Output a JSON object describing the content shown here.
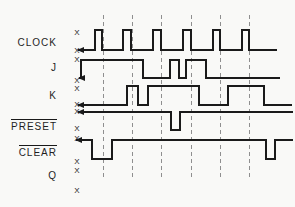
{
  "chart_data": {
    "type": "timing-diagram",
    "background": "#f9f9f7",
    "line_color": "#1a1a1a",
    "dash_color": "#8f8f8f",
    "mark_color": "#222222",
    "unknown_mark_glyph": "X",
    "dashed_lines": {
      "xs": [
        103.5,
        132.5,
        161.5,
        191.5,
        220.5,
        249.5
      ],
      "y_top": 15,
      "y_bottom": 178
    },
    "signals": [
      {
        "label": "CLOCK",
        "overline": false,
        "x_marks": [
          {
            "x": 77,
            "y": 32
          },
          {
            "x": 77,
            "y": 50
          }
        ],
        "waveform": {
          "start_x": 78,
          "end_x": 277,
          "start_level": 0,
          "high_y": 30,
          "low_y": 50,
          "arrow": true,
          "transitions": [
            {
              "x": 95,
              "to": 1
            },
            {
              "x": 102,
              "to": 0
            },
            {
              "x": 123,
              "to": 1
            },
            {
              "x": 131,
              "to": 0
            },
            {
              "x": 153,
              "to": 1
            },
            {
              "x": 161,
              "to": 0
            },
            {
              "x": 183,
              "to": 1
            },
            {
              "x": 191,
              "to": 0
            },
            {
              "x": 213,
              "to": 1
            },
            {
              "x": 220,
              "to": 0
            },
            {
              "x": 242,
              "to": 1
            },
            {
              "x": 249,
              "to": 0
            }
          ]
        }
      },
      {
        "label": "J",
        "overline": false,
        "x_marks": [
          {
            "x": 77,
            "y": 59
          },
          {
            "x": 77,
            "y": 80
          }
        ],
        "waveform": {
          "start_x": 79,
          "end_x": 280,
          "start_level": 0,
          "high_y": 60,
          "low_y": 78,
          "arrow": true,
          "transitions": [
            {
              "x": 81,
              "to": 1
            },
            {
              "x": 143,
              "to": 0
            },
            {
              "x": 170,
              "to": 1
            },
            {
              "x": 179,
              "to": 0
            },
            {
              "x": 186,
              "to": 1
            },
            {
              "x": 206,
              "to": 0
            }
          ]
        }
      },
      {
        "label": "K",
        "overline": false,
        "x_marks": [
          {
            "x": 77,
            "y": 88
          },
          {
            "x": 77,
            "y": 104
          }
        ],
        "waveform": {
          "start_x": 78,
          "end_x": 292,
          "start_level": 0,
          "high_y": 86,
          "low_y": 105,
          "arrow": true,
          "transitions": [
            {
              "x": 127,
              "to": 1
            },
            {
              "x": 138,
              "to": 0
            },
            {
              "x": 148,
              "to": 1
            },
            {
              "x": 199,
              "to": 0
            },
            {
              "x": 228,
              "to": 1
            },
            {
              "x": 264,
              "to": 0
            }
          ]
        }
      },
      {
        "label": "PRESET",
        "overline": true,
        "x_marks": [
          {
            "x": 77,
            "y": 111
          },
          {
            "x": 77,
            "y": 128
          }
        ],
        "waveform": {
          "start_x": 78,
          "end_x": 293,
          "start_level": 1,
          "high_y": 112,
          "low_y": 130,
          "arrow": true,
          "transitions": [
            {
              "x": 171,
              "to": 0
            },
            {
              "x": 180,
              "to": 1
            }
          ]
        }
      },
      {
        "label": "CLEAR",
        "overline": true,
        "x_marks": [
          {
            "x": 77,
            "y": 138
          },
          {
            "x": 77,
            "y": 161
          }
        ],
        "waveform": {
          "start_x": 76,
          "end_x": 293,
          "start_level": 1,
          "high_y": 140,
          "low_y": 159,
          "arrow": true,
          "transitions": [
            {
              "x": 92,
              "to": 0
            },
            {
              "x": 112,
              "to": 1
            },
            {
              "x": 266,
              "to": 0
            },
            {
              "x": 275,
              "to": 1
            }
          ]
        }
      },
      {
        "label": "Q",
        "overline": false,
        "x_marks": [
          {
            "x": 77,
            "y": 170
          },
          {
            "x": 77,
            "y": 190
          }
        ],
        "waveform": null
      }
    ]
  }
}
